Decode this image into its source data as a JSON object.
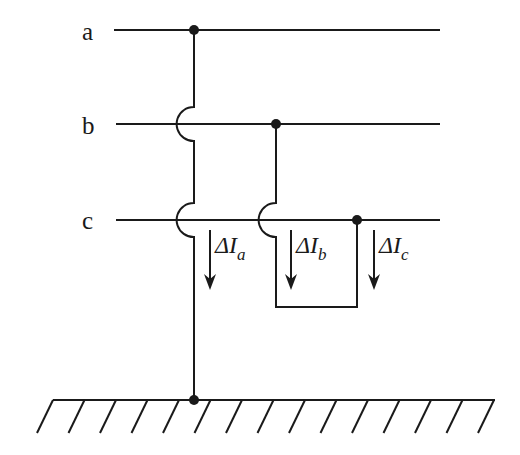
{
  "diagram": {
    "type": "three-phase ground fault circuit",
    "buses": [
      {
        "id": "a",
        "label": "a",
        "y": 30
      },
      {
        "id": "b",
        "label": "b",
        "y": 124
      },
      {
        "id": "c",
        "label": "c",
        "y": 220
      }
    ],
    "currents": [
      {
        "id": "Ia",
        "delta": "ΔI",
        "sub": "a"
      },
      {
        "id": "Ib",
        "delta": "ΔI",
        "sub": "b"
      },
      {
        "id": "Ic",
        "delta": "ΔI",
        "sub": "c"
      }
    ],
    "junctions": [
      "a-bus tap",
      "b-bus tap",
      "c-bus tap",
      "ground"
    ],
    "ground": {
      "label": "",
      "hatch_count": 15
    },
    "colors": {
      "line": "#1a1a1a",
      "background": "#ffffff"
    }
  }
}
